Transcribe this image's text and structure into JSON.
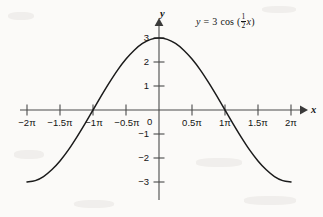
{
  "figure": {
    "equation": {
      "lhs": "y",
      "equals": "=",
      "amplitude": "3",
      "function": "cos",
      "open_paren": "(",
      "frac_numerator": "1",
      "frac_denominator": "2",
      "variable": "x",
      "close_paren": ")",
      "plain": "y = 3 cos (1/2 x)"
    },
    "axis_labels": {
      "x": "x",
      "y": "y"
    },
    "origin_label": "0",
    "colors": {
      "background": "#fbfaf8",
      "axis": "#4a4a4a",
      "curve": "#1b1b1b",
      "text": "#141414"
    }
  },
  "chart_data": {
    "type": "line",
    "xlabel": "x",
    "ylabel": "y",
    "xlim": [
      -6.283185307,
      6.283185307
    ],
    "ylim": [
      -3,
      3
    ],
    "grid": false,
    "legend": "none",
    "annotations": [
      "y = 3 cos (1/2 x)"
    ],
    "x_ticks": [
      {
        "value": -6.283185307,
        "label": "−2π"
      },
      {
        "value": -4.71238898,
        "label": "−1.5π"
      },
      {
        "value": -3.141592654,
        "label": "−1π"
      },
      {
        "value": -1.570796327,
        "label": "−0.5π"
      },
      {
        "value": 0,
        "label": "0"
      },
      {
        "value": 1.570796327,
        "label": "0.5π"
      },
      {
        "value": 3.141592654,
        "label": "1π"
      },
      {
        "value": 4.71238898,
        "label": "1.5π"
      },
      {
        "value": 6.283185307,
        "label": "2π"
      }
    ],
    "y_ticks": [
      {
        "value": 3,
        "label": "3"
      },
      {
        "value": 2,
        "label": "2"
      },
      {
        "value": 1,
        "label": "1"
      },
      {
        "value": -1,
        "label": "−1"
      },
      {
        "value": -2,
        "label": "−2"
      },
      {
        "value": -3,
        "label": "−3"
      }
    ],
    "series": [
      {
        "name": "y = 3 cos (1/2 x)",
        "formula": "3*cos(x/2)",
        "amplitude": 3,
        "period": 12.566370614,
        "x": [
          -6.2831853,
          -5.8904862,
          -5.4977871,
          -5.1050881,
          -4.712389,
          -4.3196899,
          -3.9269908,
          -3.5342917,
          -3.1415927,
          -2.7488936,
          -2.3561945,
          -1.9634954,
          -1.5707963,
          -1.1780972,
          -0.7853982,
          -0.3926991,
          0.0,
          0.3926991,
          0.7853982,
          1.1780972,
          1.5707963,
          1.9634954,
          2.3561945,
          2.7488936,
          3.1415927,
          3.5342917,
          3.9269908,
          4.3196899,
          4.712389,
          5.1050881,
          5.4977871,
          5.8904862,
          6.2831853
        ],
        "y": [
          -3.0,
          -2.9428,
          -2.7716,
          -2.4914,
          -2.1213,
          -1.6714,
          -1.1481,
          -0.5853,
          0.0,
          0.5853,
          1.1481,
          1.6714,
          2.1213,
          2.4914,
          2.7716,
          2.9428,
          3.0,
          2.9428,
          2.7716,
          2.4914,
          2.1213,
          1.6714,
          1.1481,
          0.5853,
          0.0,
          -0.5853,
          -1.1481,
          -1.6714,
          -2.1213,
          -2.4914,
          -2.7716,
          -2.9428,
          -3.0
        ]
      }
    ]
  }
}
